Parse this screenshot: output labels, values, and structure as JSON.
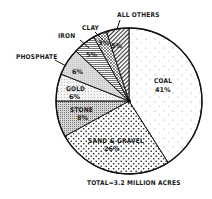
{
  "chart_data": {
    "type": "pie",
    "title": "",
    "total_label": "TOTAL=3.2 MILLION ACRES",
    "start_angle_deg": 0,
    "direction": "clockwise",
    "slices": [
      {
        "label": "COAL",
        "value": 41,
        "pct_label": "41%",
        "pattern": "sparse-dots"
      },
      {
        "label": "SAND & GRAVEL",
        "value": 26,
        "pct_label": "26%",
        "pattern": "dense-dots"
      },
      {
        "label": "STONE",
        "value": 8,
        "pct_label": "8%",
        "pattern": "fine-stipple"
      },
      {
        "label": "GOLD",
        "value": 6,
        "pct_label": "6%",
        "pattern": "light-stipple"
      },
      {
        "label": "PHOSPHATE",
        "value": 6,
        "pct_label": "6%",
        "pattern": "gray-fill"
      },
      {
        "label": "IRON",
        "value": 5,
        "pct_label": "5%",
        "pattern": "horizontal-lines"
      },
      {
        "label": "CLAY",
        "value": 3,
        "pct_label": "3%",
        "pattern": "cross-hatch"
      },
      {
        "label": "ALL OTHERS",
        "value": 5,
        "pct_label": "5%",
        "pattern": "diagonal-hatch"
      }
    ],
    "categories": [
      "COAL",
      "SAND & GRAVEL",
      "STONE",
      "GOLD",
      "PHOSPHATE",
      "IRON",
      "CLAY",
      "ALL OTHERS"
    ],
    "values": [
      41,
      26,
      8,
      6,
      6,
      5,
      3,
      5
    ],
    "unit": "%"
  },
  "labels": {
    "coal": "COAL",
    "coal_pct": "41%",
    "sand": "SAND & GRAVEL",
    "sand_pct": "26%",
    "stone": "STONE",
    "stone_pct": "8%",
    "gold": "GOLD",
    "gold_pct": "6%",
    "phosphate": "PHOSPHATE",
    "phosphate_pct": "6%",
    "iron": "IRON",
    "iron_pct": "5%",
    "clay": "CLAY",
    "clay_pct": "3%",
    "others": "ALL OTHERS",
    "others_pct": "5%",
    "total": "TOTAL=3.2 MILLION ACRES"
  }
}
